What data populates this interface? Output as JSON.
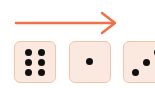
{
  "arrow": {
    "direction": "right",
    "color": "#f0704a",
    "icon": "arrow-right-icon"
  },
  "dice": [
    {
      "value": 6,
      "face_color": "#fbe9e0",
      "border_color": "#f2c4ae"
    },
    {
      "value": 1,
      "face_color": "#fbe9e0",
      "border_color": "#f2c4ae"
    },
    {
      "value": 3,
      "face_color": "#fbe9e0",
      "border_color": "#f2c4ae"
    }
  ]
}
